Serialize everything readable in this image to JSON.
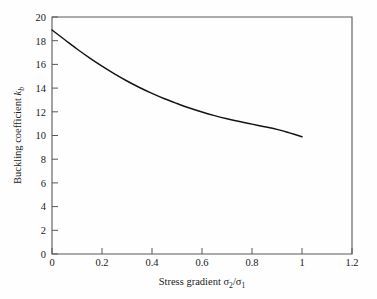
{
  "chart_data": {
    "type": "line",
    "title": "",
    "xlabel": "Stress gradient σ₂/σ₁",
    "ylabel": "Buckling coefficient kₙ",
    "ylabel_parts": {
      "text": "Buckling coefficient ",
      "symbol": "k",
      "subscript": "b"
    },
    "xlabel_parts": {
      "text": "Stress gradient ",
      "num_symbol": "σ",
      "num_sub": "2",
      "slash": "/",
      "den_symbol": "σ",
      "den_sub": "1"
    },
    "xlim": [
      0,
      1.2
    ],
    "ylim": [
      0,
      20
    ],
    "grid": false,
    "legend": null,
    "x_ticks": [
      "0",
      "0.2",
      "0.4",
      "0.6",
      "0.8",
      "1",
      "1.2"
    ],
    "x_tick_values": [
      0,
      0.2,
      0.4,
      0.6,
      0.8,
      1.0,
      1.2
    ],
    "y_ticks": [
      "0",
      "2",
      "4",
      "6",
      "8",
      "10",
      "12",
      "14",
      "16",
      "18",
      "20"
    ],
    "y_tick_values": [
      0,
      2,
      4,
      6,
      8,
      10,
      12,
      14,
      16,
      18,
      20
    ],
    "x": [
      0.0,
      0.05,
      0.1,
      0.15,
      0.2,
      0.25,
      0.3,
      0.35,
      0.4,
      0.45,
      0.5,
      0.55,
      0.6,
      0.65,
      0.7,
      0.75,
      0.8,
      0.85,
      0.9,
      0.95,
      1.0
    ],
    "values": [
      18.9,
      18.1,
      17.3,
      16.55,
      15.85,
      15.2,
      14.6,
      14.05,
      13.55,
      13.1,
      12.7,
      12.32,
      11.98,
      11.68,
      11.42,
      11.18,
      10.96,
      10.74,
      10.52,
      10.22,
      9.9
    ],
    "series": [
      {
        "name": "Buckling coefficient",
        "x": [
          0.0,
          0.05,
          0.1,
          0.15,
          0.2,
          0.25,
          0.3,
          0.35,
          0.4,
          0.45,
          0.5,
          0.55,
          0.6,
          0.65,
          0.7,
          0.75,
          0.8,
          0.85,
          0.9,
          0.95,
          1.0
        ],
        "values": [
          18.9,
          18.1,
          17.3,
          16.55,
          15.85,
          15.2,
          14.6,
          14.05,
          13.55,
          13.1,
          12.7,
          12.32,
          11.98,
          11.68,
          11.42,
          11.18,
          10.96,
          10.74,
          10.52,
          10.22,
          9.9
        ],
        "color": "#141414"
      }
    ]
  },
  "colors": {
    "background": "#fefefe",
    "axis": "#58585a",
    "curve": "#141414",
    "text": "#1a1a1a"
  }
}
